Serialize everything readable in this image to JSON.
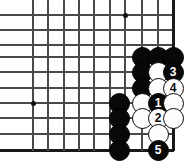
{
  "figure": {
    "kind": "go-board-diagram",
    "width": 188,
    "height": 164,
    "background_color": "#ffffff"
  },
  "board": {
    "line_color": "#4a4a4a",
    "edge_line_color": "#1a1a1a",
    "spacing": 15.3,
    "columns_x": [
      33,
      48,
      64,
      79,
      94,
      110,
      125,
      142,
      158,
      173
    ],
    "rows_y": [
      15,
      30,
      45,
      57,
      72,
      88,
      103,
      118,
      134,
      150
    ],
    "right_edge_x": 173,
    "bottom_edge_y": 150,
    "horizontal_lines_y": [
      15,
      30,
      45,
      57,
      72,
      88,
      103,
      118,
      134,
      150
    ],
    "vertical_lines_x": [
      33,
      48,
      64,
      79,
      94,
      110,
      125,
      142,
      158,
      173
    ],
    "star_points": [
      {
        "name": "hoshi-top",
        "x": 125,
        "y": 15
      },
      {
        "name": "hoshi-left",
        "x": 33,
        "y": 103
      }
    ]
  },
  "stones": [
    {
      "id": "black-a",
      "color": "black",
      "x": 142,
      "y": 57,
      "number": ""
    },
    {
      "id": "black-b",
      "color": "black",
      "x": 158,
      "y": 57,
      "number": ""
    },
    {
      "id": "black-c",
      "color": "black",
      "x": 173,
      "y": 57,
      "number": ""
    },
    {
      "id": "black-d",
      "color": "black",
      "x": 142,
      "y": 72,
      "number": ""
    },
    {
      "id": "white-a",
      "color": "white",
      "x": 158,
      "y": 72,
      "number": ""
    },
    {
      "id": "move-3",
      "color": "black",
      "x": 173,
      "y": 72,
      "number": "3"
    },
    {
      "id": "black-e",
      "color": "black",
      "x": 142,
      "y": 88,
      "number": ""
    },
    {
      "id": "white-b",
      "color": "white",
      "x": 158,
      "y": 88,
      "number": ""
    },
    {
      "id": "move-4",
      "color": "white",
      "x": 173,
      "y": 88,
      "number": "4"
    },
    {
      "id": "black-f",
      "color": "black",
      "x": 119,
      "y": 103,
      "number": ""
    },
    {
      "id": "white-c",
      "color": "white",
      "x": 142,
      "y": 103,
      "number": ""
    },
    {
      "id": "move-1",
      "color": "black",
      "x": 158,
      "y": 103,
      "number": "1"
    },
    {
      "id": "white-d",
      "color": "white",
      "x": 173,
      "y": 103,
      "number": ""
    },
    {
      "id": "black-g",
      "color": "black",
      "x": 119,
      "y": 118,
      "number": ""
    },
    {
      "id": "white-e",
      "color": "white",
      "x": 142,
      "y": 118,
      "number": ""
    },
    {
      "id": "move-2",
      "color": "white",
      "x": 158,
      "y": 118,
      "number": "2"
    },
    {
      "id": "white-f",
      "color": "white",
      "x": 173,
      "y": 118,
      "number": ""
    },
    {
      "id": "black-h",
      "color": "black",
      "x": 119,
      "y": 134,
      "number": ""
    },
    {
      "id": "white-g",
      "color": "white",
      "x": 158,
      "y": 134,
      "number": ""
    },
    {
      "id": "black-i",
      "color": "black",
      "x": 119,
      "y": 150,
      "number": ""
    },
    {
      "id": "move-5",
      "color": "black",
      "x": 158,
      "y": 150,
      "number": "5"
    }
  ],
  "move_numbers": [
    "1",
    "2",
    "3",
    "4",
    "5"
  ]
}
